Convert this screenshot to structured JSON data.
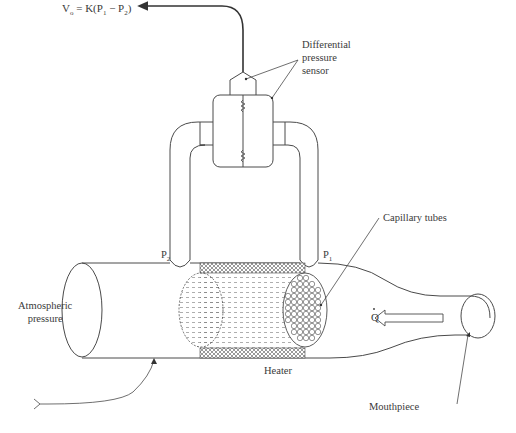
{
  "diagram": {
    "type": "pneumotachograph schematic",
    "equation": {
      "lhs": "V",
      "lhs_sub": "o",
      "rhs_prefix": " = K(P",
      "p1_sub": "1",
      "minus": " − P",
      "p2_sub": "2",
      "close": ")"
    },
    "labels": {
      "sensor_line1": "Differential",
      "sensor_line2": "pressure",
      "sensor_line3": "sensor",
      "capillary": "Capillary tubes",
      "atmospheric_line1": "Atmospheric",
      "atmospheric_line2": "pressure",
      "heater": "Heater",
      "mouthpiece": "Mouthpiece",
      "flow_symbol": "Q",
      "p1": "P",
      "p1_sub": "1",
      "p2": "P",
      "p2_sub": "2"
    },
    "colors": {
      "line": "#4a4a4a",
      "text": "#3a3a3a",
      "background": "#ffffff"
    }
  }
}
